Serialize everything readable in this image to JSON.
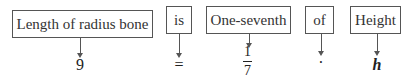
{
  "diagram": {
    "words": [
      {
        "label": "Length of radius bone",
        "symbol": "9"
      },
      {
        "label": "is",
        "symbol": "="
      },
      {
        "label": "One-seventh",
        "symbol_numerator": "1",
        "symbol_denominator": "7"
      },
      {
        "label": "of",
        "symbol": "·"
      },
      {
        "label": "Height",
        "symbol": "h"
      }
    ]
  }
}
